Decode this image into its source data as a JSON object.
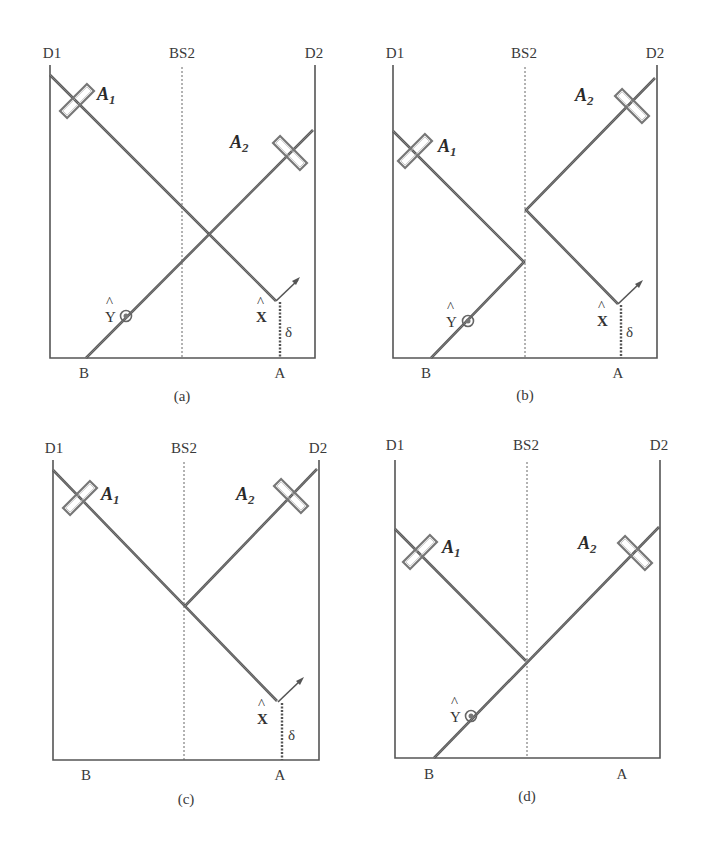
{
  "figure": {
    "panels": [
      {
        "id": "a",
        "caption": "(a)",
        "labels": {
          "left_detector": "D1",
          "beamsplitter": "BS2",
          "right_detector": "D2",
          "port_b": "B",
          "port_a": "A"
        },
        "analyzers": [
          {
            "name": "A",
            "subscript": "1"
          },
          {
            "name": "A",
            "subscript": "2"
          }
        ],
        "markers": {
          "x_hat": "X",
          "y_hat": "Y",
          "delta": "δ",
          "hat": "^"
        },
        "shows_x": true,
        "shows_y": true
      },
      {
        "id": "b",
        "caption": "(b)",
        "labels": {
          "left_detector": "D1",
          "beamsplitter": "BS2",
          "right_detector": "D2",
          "port_b": "B",
          "port_a": "A"
        },
        "analyzers": [
          {
            "name": "A",
            "subscript": "1"
          },
          {
            "name": "A",
            "subscript": "2"
          }
        ],
        "markers": {
          "x_hat": "X",
          "y_hat": "Y",
          "delta": "δ",
          "hat": "^"
        },
        "shows_x": true,
        "shows_y": true
      },
      {
        "id": "c",
        "caption": "(c)",
        "labels": {
          "left_detector": "D1",
          "beamsplitter": "BS2",
          "right_detector": "D2",
          "port_b": "B",
          "port_a": "A"
        },
        "analyzers": [
          {
            "name": "A",
            "subscript": "1"
          },
          {
            "name": "A",
            "subscript": "2"
          }
        ],
        "markers": {
          "x_hat": "X",
          "delta": "δ",
          "hat": "^"
        },
        "shows_x": true,
        "shows_y": false
      },
      {
        "id": "d",
        "caption": "(d)",
        "labels": {
          "left_detector": "D1",
          "beamsplitter": "BS2",
          "right_detector": "D2",
          "port_b": "B",
          "port_a": "A"
        },
        "analyzers": [
          {
            "name": "A",
            "subscript": "1"
          },
          {
            "name": "A",
            "subscript": "2"
          }
        ],
        "markers": {
          "y_hat": "Y",
          "hat": "^"
        },
        "shows_x": false,
        "shows_y": true
      }
    ]
  }
}
